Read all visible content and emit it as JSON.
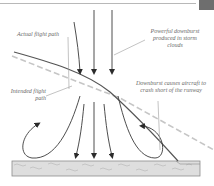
{
  "diagram": {
    "labels": {
      "actual_flight_path": "Actual flight path",
      "powerful_downburst": "Powerful downburst produced in storm clouds",
      "intended_flight_path": "Intended flight path",
      "downburst_causes": "Downburst causes aircraft to crash short of the runway"
    },
    "elements": {
      "downdraft_arrows": 6,
      "outflow_curl_arrows": 2,
      "runway": "runway"
    },
    "colors": {
      "line": "#555555",
      "dashed_path": "#bdbdbd",
      "runway_fill": "#dcdcdc",
      "runway_border": "#8c8c8c",
      "label_text": "#6a6a6a",
      "corner_square": "#6e6e6e"
    }
  }
}
